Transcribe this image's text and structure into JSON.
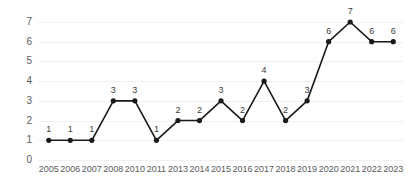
{
  "chart_data": {
    "type": "line",
    "title": "",
    "subtitle": "",
    "xlabel": "",
    "ylabel": "",
    "categories": [
      "2005",
      "2006",
      "2007",
      "2008",
      "2010",
      "2011",
      "2013",
      "2014",
      "2015",
      "2016",
      "2017",
      "2018",
      "2019",
      "2020",
      "2021",
      "2022",
      "2023"
    ],
    "values": [
      1,
      1,
      1,
      3,
      3,
      1,
      2,
      2,
      3,
      2,
      4,
      2,
      3,
      6,
      7,
      6,
      6
    ],
    "point_labels": [
      "1",
      "1",
      "1",
      "3",
      "3",
      "1",
      "2",
      "2",
      "3",
      "2",
      "4",
      "2",
      "3",
      "6",
      "7",
      "6",
      "6"
    ],
    "ylim": [
      0,
      7
    ],
    "yticks": [
      0,
      1,
      2,
      3,
      4,
      5,
      6,
      7
    ],
    "ytick_labels": [
      "0",
      "1",
      "2",
      "3",
      "4",
      "5",
      "6",
      "7"
    ],
    "grid": true,
    "legend": "none",
    "series": [
      {
        "name": "",
        "values": [
          1,
          1,
          1,
          3,
          3,
          1,
          2,
          2,
          3,
          2,
          4,
          2,
          3,
          6,
          7,
          6,
          6
        ],
        "color": "#1a1a1a",
        "marker": "circle",
        "show_labels": true
      }
    ]
  },
  "colors": {
    "background": "#ffffff",
    "line": "#1a1a1a",
    "marker": "#1a1a1a",
    "gridline": "#f0f0f0",
    "tick_text": "#5a5a5a",
    "label_text": "#3c3c3c"
  }
}
